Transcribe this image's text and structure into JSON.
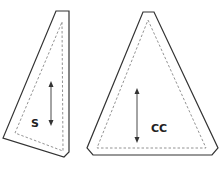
{
  "diagram": {
    "type": "quilt-pattern-templates",
    "pieces": [
      {
        "id": "S",
        "label": "S",
        "shape": "narrow right triangle template with trimmed corners",
        "grain_arrow": "vertical double-headed",
        "outline": [
          [
            56,
            11
          ],
          [
            69,
            11
          ],
          [
            69,
            152
          ],
          [
            64,
            157
          ],
          [
            3,
            138
          ]
        ],
        "seam_line": [
          [
            62,
            22
          ],
          [
            63,
            151
          ],
          [
            15,
            133
          ]
        ]
      },
      {
        "id": "CC",
        "label": "CC",
        "shape": "isosceles triangle template with trimmed corners",
        "grain_arrow": "vertical double-headed",
        "outline": [
          [
            143,
            12
          ],
          [
            154,
            12
          ],
          [
            218,
            148
          ],
          [
            212,
            155
          ],
          [
            93,
            155
          ],
          [
            87,
            148
          ]
        ],
        "seam_line": [
          [
            148,
            20
          ],
          [
            206,
            148
          ],
          [
            97,
            148
          ]
        ]
      }
    ],
    "colors": {
      "cut_line": "#333333",
      "seam_line": "#777777",
      "arrow": "#333333",
      "background": "#ffffff"
    }
  }
}
